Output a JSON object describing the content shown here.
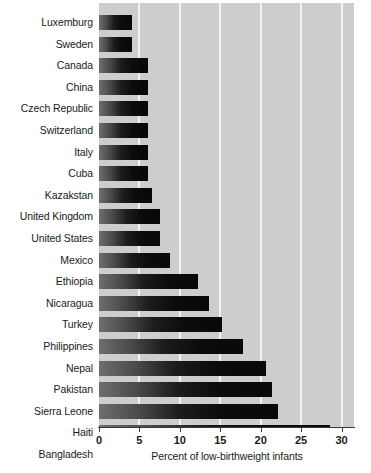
{
  "chart_data": {
    "type": "bar",
    "orientation": "horizontal",
    "title": "",
    "xlabel": "Percent of low-birthweight infants",
    "ylabel": "",
    "xlim": [
      0,
      30
    ],
    "xticks": [
      0,
      5,
      10,
      15,
      20,
      25,
      30
    ],
    "xtick_labels": [
      "0",
      "5",
      "10",
      "15",
      "20",
      "25",
      "30"
    ],
    "grid": "vertical-white",
    "legend": "none",
    "plot_background": "#cdcdcd",
    "bar_gradient_start": "#6e6e6e",
    "bar_gradient_end": "#090909",
    "categories": [
      "Luxemburg",
      "Sweden",
      "Canada",
      "China",
      "Czech Republic",
      "Switzerland",
      "Italy",
      "Cuba",
      "Kazakstan",
      "United Kingdom",
      "United States",
      "Mexico",
      "Ethiopia",
      "Nicaragua",
      "Turkey",
      "Philippines",
      "Nepal",
      "Pakistan",
      "Sierra Leone",
      "Haiti",
      "Bangladesh"
    ],
    "values": [
      4.1,
      4.1,
      6.0,
      6.0,
      6.0,
      6.0,
      6.0,
      6.0,
      6.5,
      7.6,
      7.6,
      8.8,
      12.3,
      13.6,
      15.2,
      17.8,
      20.6,
      21.4,
      22.1,
      28.6,
      30.3
    ]
  }
}
